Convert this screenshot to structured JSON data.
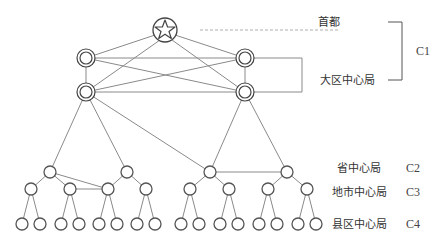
{
  "diagram": {
    "title": "",
    "labels": {
      "capital": "首都",
      "regional": "大区中心局",
      "province": "省中心局",
      "city": "地市中心局",
      "county": "县区中心局"
    },
    "levels": {
      "c1": "C1",
      "c2": "C2",
      "c3": "C3",
      "c4": "C4"
    },
    "colors": {
      "line": "#8a8a8a",
      "node": "#555555",
      "text": "#333333"
    },
    "nodes": {
      "capital": {
        "x": 165,
        "y": 30,
        "icon": "star-icon"
      },
      "regional": [
        {
          "x": 86,
          "y": 58
        },
        {
          "x": 86,
          "y": 92
        },
        {
          "x": 245,
          "y": 58
        },
        {
          "x": 245,
          "y": 92
        }
      ],
      "province": [
        {
          "x": 50,
          "y": 172
        },
        {
          "x": 127,
          "y": 172
        },
        {
          "x": 210,
          "y": 172
        },
        {
          "x": 287,
          "y": 172
        }
      ],
      "city": [
        {
          "x": 31,
          "y": 189
        },
        {
          "x": 70,
          "y": 189
        },
        {
          "x": 108,
          "y": 189
        },
        {
          "x": 146,
          "y": 189
        },
        {
          "x": 190,
          "y": 189
        },
        {
          "x": 229,
          "y": 189
        },
        {
          "x": 268,
          "y": 189
        },
        {
          "x": 307,
          "y": 189
        }
      ],
      "county_count": 16
    }
  }
}
